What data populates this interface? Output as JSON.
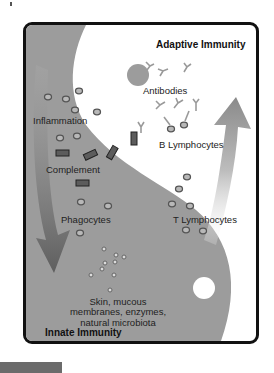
{
  "diagram": {
    "title_adaptive": "Adaptive Immunity",
    "title_innate": "Innate Immunity",
    "labels": {
      "antibodies": "Antibodies",
      "b_lymphocytes": "B Lymphocytes",
      "t_lymphocytes": "T Lymphocytes",
      "inflammation": "Inflammation",
      "complement": "Complement",
      "phagocytes": "Phagocytes",
      "barriers_line1": "Skin, mucous",
      "barriers_line2": "membranes, enzymes,",
      "barriers_line3": "natural microbiota"
    },
    "arrows": {
      "up_arrow": "adaptive-immunity-arrow",
      "down_arrow": "innate-immunity-arrow"
    },
    "colors": {
      "innate_region": "#9a9a9a",
      "adaptive_region": "#ffffff",
      "frame": "#111111",
      "arrow": "#7a7a7a",
      "complement_block": "#5a5a5a",
      "cell_fill": "#b5b5b5"
    }
  }
}
